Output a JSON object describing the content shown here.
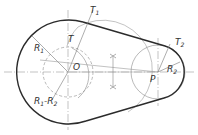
{
  "diagram": {
    "colors": {
      "thick": "#2b2b2b",
      "thin": "#8a8a8a",
      "text": "#333333"
    },
    "labels": {
      "R1": "R",
      "R1_sub": "1",
      "T1": "T",
      "T1_sub": "1",
      "T": "T",
      "O": "O",
      "P": "P",
      "T2": "T",
      "T2_sub": "2",
      "R2": "R",
      "R2_sub": "2",
      "R1minusR2_a": "R",
      "R1minusR2_a_sub": "1",
      "R1minusR2_dash": "-R",
      "R1minusR2_b_sub": "2"
    }
  }
}
